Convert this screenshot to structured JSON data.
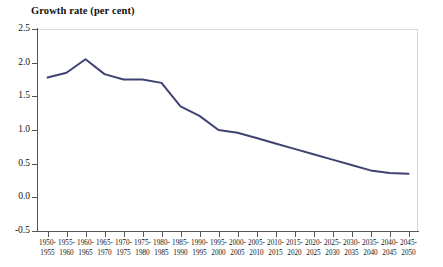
{
  "chart_data": {
    "type": "line",
    "title": "Growth rate (per cent)",
    "xlabel": "",
    "ylabel": "",
    "ylim": [
      -0.5,
      2.5
    ],
    "ytick_values": [
      2.5,
      2.0,
      1.5,
      1.0,
      0.5,
      0.0,
      -0.5
    ],
    "ytick_labels": [
      "2.5",
      "2.0",
      "1.5",
      "1.0",
      "0.5",
      "0.0",
      "-0.5"
    ],
    "grid": false,
    "legend": "none",
    "categories": [
      "1950-1955",
      "1955-1960",
      "1960-1965",
      "1965-1970",
      "1970-1975",
      "1975-1980",
      "1980-1985",
      "1985-1990",
      "1990-1995",
      "1995-2000",
      "2000-2005",
      "2005-2010",
      "2010-2015",
      "2015-2020",
      "2020-2025",
      "2025-2030",
      "2030-2035",
      "2035-2040",
      "2040-2045",
      "2045-2050"
    ],
    "category_lines": [
      [
        "1950-",
        "1955"
      ],
      [
        "1955-",
        "1960"
      ],
      [
        "1960-",
        "1965"
      ],
      [
        "1965-",
        "1970"
      ],
      [
        "1970-",
        "1975"
      ],
      [
        "1975-",
        "1980"
      ],
      [
        "1980-",
        "1985"
      ],
      [
        "1985-",
        "1990"
      ],
      [
        "1990-",
        "1995"
      ],
      [
        "1995-",
        "2000"
      ],
      [
        "2000-",
        "2005"
      ],
      [
        "2005-",
        "2010"
      ],
      [
        "2010-",
        "2015"
      ],
      [
        "2015-",
        "2020"
      ],
      [
        "2020-",
        "2025"
      ],
      [
        "2025-",
        "2030"
      ],
      [
        "2030-",
        "2035"
      ],
      [
        "2035-",
        "2040"
      ],
      [
        "2040-",
        "2045"
      ],
      [
        "2045-",
        "2050"
      ]
    ],
    "series": [
      {
        "name": "Growth rate",
        "color": "#3f4372",
        "values": [
          1.78,
          1.85,
          2.05,
          1.83,
          1.75,
          1.75,
          1.7,
          1.35,
          1.21,
          1.0,
          0.96,
          0.88,
          0.8,
          0.72,
          0.64,
          0.56,
          0.48,
          0.4,
          0.36,
          0.35
        ]
      }
    ]
  },
  "colors": {
    "line": "#3f4372",
    "axis": "#56565c",
    "frame": "#d8d8dc",
    "background": "#ffffff",
    "text": "#141414"
  }
}
